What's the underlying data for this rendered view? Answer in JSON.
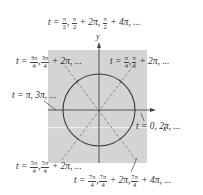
{
  "diagram": {
    "axes": {
      "x_label": "x",
      "y_label": "y"
    },
    "colors": {
      "panel": "#d4d4d4",
      "stripe": "#ececec",
      "circle": "#3a3a3a",
      "dashed": "#8a8a8a",
      "axis": "#444444"
    },
    "labels": {
      "top": {
        "prefix": "t =",
        "f1n": "π",
        "f1d": "2",
        "f2n": "π",
        "f2d": "2",
        "mid": "+ 2π,",
        "f3n": "π",
        "f3d": "2",
        "tail": "+ 4π, ..."
      },
      "upper_left": {
        "prefix": "t =",
        "f1n": "3π",
        "f1d": "4",
        "f2n": "3π",
        "f2d": "4",
        "tail": "+ 2π, ..."
      },
      "upper_right": {
        "prefix": "t =",
        "f1n": "π",
        "f1d": "4",
        "f2n": "π",
        "f2d": "4",
        "tail": "+ 2π, ..."
      },
      "left": {
        "text": "t = π, 3π, ..."
      },
      "right": {
        "text": "t = 0, 2π, ..."
      },
      "lower_left": {
        "prefix": "t =",
        "f1n": "5π",
        "f1d": "4",
        "f2n": "5π",
        "f2d": "4",
        "tail": "+ 2π, ..."
      },
      "bottom": {
        "prefix": "t =",
        "f1n": "7π",
        "f1d": "4",
        "f2n": "7π",
        "f2d": "4",
        "mid": "+ 2π,",
        "f3n": "7π",
        "f3d": "4",
        "tail": "+ 4π, ..."
      }
    }
  }
}
